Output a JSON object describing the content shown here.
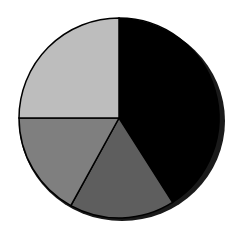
{
  "chart_data": {
    "type": "pie",
    "title": "",
    "legend": null,
    "start_angle_deg": 0,
    "direction": "clockwise",
    "slices": [
      {
        "label": "",
        "value": 41,
        "color": "#000000"
      },
      {
        "label": "",
        "value": 17,
        "color": "#5e5e5e"
      },
      {
        "label": "",
        "value": 17,
        "color": "#7f7f7f"
      },
      {
        "label": "",
        "value": 25,
        "color": "#bdbdbd"
      }
    ],
    "values": [
      41,
      17,
      17,
      25
    ],
    "categories": [
      "",
      "",
      "",
      ""
    ],
    "data_labels_shown": false
  },
  "geometry": {
    "cx": 119,
    "cy": 118,
    "r": 100,
    "stroke": "#000000"
  }
}
